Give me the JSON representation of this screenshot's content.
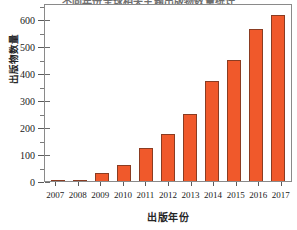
{
  "chart_data": {
    "type": "bar",
    "title": "不同年份全球相关主题出版物数量统计",
    "xlabel": "出版年份",
    "ylabel": "出版物数量",
    "categories": [
      "2007",
      "2008",
      "2009",
      "2010",
      "2011",
      "2012",
      "2013",
      "2014",
      "2015",
      "2016",
      "2017"
    ],
    "values": [
      2,
      3,
      28,
      58,
      122,
      175,
      248,
      372,
      447,
      562,
      617
    ],
    "ylim": [
      0,
      660
    ],
    "y_major_ticks": [
      0,
      100,
      200,
      300,
      400,
      500,
      600
    ],
    "y_minor_ticks": [
      50,
      150,
      250,
      350,
      450,
      550,
      650
    ],
    "ytick_labels": [
      "0",
      "100",
      "200",
      "300",
      "400",
      "500",
      "600"
    ],
    "grid": false,
    "legend": null,
    "bar_color": "#F0592B",
    "bar_edge_color": "#8A3C22",
    "axis_color": "#8A8A8A"
  }
}
